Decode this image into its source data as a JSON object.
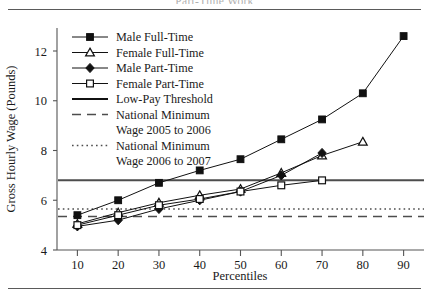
{
  "figure": {
    "clipped_title": "Part-Time Work",
    "has_top_rule": true,
    "has_bottom_rule": true
  },
  "chart_data": {
    "type": "line",
    "title": "",
    "xlabel": "Percentiles",
    "ylabel": "Gross Hourly Wage (Pounds)",
    "x": [
      10,
      20,
      30,
      40,
      50,
      60,
      70,
      80,
      90
    ],
    "xlim": [
      5,
      95
    ],
    "ylim": [
      4,
      13
    ],
    "yticks": [
      4,
      6,
      8,
      10,
      12
    ],
    "xticks": [
      10,
      20,
      30,
      40,
      50,
      60,
      70,
      80,
      90
    ],
    "grid": false,
    "legend_position": "top-left-inside",
    "series": [
      {
        "name": "Male Full-Time",
        "marker": "filled-square",
        "linestyle": "solid",
        "color": "#111111",
        "x": [
          10,
          20,
          30,
          40,
          50,
          60,
          70,
          80,
          90
        ],
        "values": [
          5.4,
          6.0,
          6.7,
          7.2,
          7.65,
          8.45,
          9.25,
          10.3,
          12.6
        ]
      },
      {
        "name": "Female Full-Time",
        "marker": "open-triangle",
        "linestyle": "solid",
        "color": "#111111",
        "x": [
          10,
          20,
          30,
          40,
          50,
          60,
          70,
          80
        ],
        "values": [
          5.05,
          5.5,
          5.9,
          6.2,
          6.45,
          7.1,
          7.8,
          8.35
        ]
      },
      {
        "name": "Male Part-Time",
        "marker": "filled-diamond",
        "linestyle": "solid",
        "color": "#111111",
        "x": [
          10,
          20,
          30,
          40,
          50,
          60,
          70
        ],
        "values": [
          4.95,
          5.2,
          5.65,
          6.0,
          6.35,
          7.0,
          7.9
        ]
      },
      {
        "name": "Female Part-Time",
        "marker": "open-square",
        "linestyle": "solid",
        "color": "#111111",
        "x": [
          10,
          20,
          30,
          40,
          50,
          60,
          70
        ],
        "values": [
          5.0,
          5.4,
          5.8,
          6.05,
          6.35,
          6.6,
          6.8
        ]
      }
    ],
    "reference_lines": [
      {
        "name": "Low-Pay Threshold",
        "linestyle": "solid",
        "value": 6.8,
        "color": "#4d4d4d"
      },
      {
        "name": "National Minimum Wage 2005 to 2006",
        "linestyle": "dashed",
        "value": 5.35,
        "color": "#4d4d4d"
      },
      {
        "name": "National Minimum Wage 2006 to 2007",
        "linestyle": "dotted",
        "value": 5.65,
        "color": "#4d4d4d"
      }
    ],
    "annotations": []
  },
  "legend": {
    "entries": [
      {
        "label": "Male Full-Time",
        "marker": "filled-square",
        "linestyle": "solid"
      },
      {
        "label": "Female Full-Time",
        "marker": "open-triangle",
        "linestyle": "solid"
      },
      {
        "label": "Male Part-Time",
        "marker": "filled-diamond",
        "linestyle": "solid"
      },
      {
        "label": "Female Part-Time",
        "marker": "open-square",
        "linestyle": "solid"
      },
      {
        "label": "Low-Pay Threshold",
        "marker": "none",
        "linestyle": "solid"
      },
      {
        "label": "National Minimum",
        "label2": "Wage 2005 to 2006",
        "marker": "none",
        "linestyle": "dashed"
      },
      {
        "label": "National Minimum",
        "label2": "Wage 2006 to 2007",
        "marker": "none",
        "linestyle": "dotted"
      }
    ]
  },
  "axes": {
    "y_title": "Gross Hourly Wage (Pounds)",
    "x_title": "Percentiles",
    "y_tick_labels": [
      "4",
      "6",
      "8",
      "10",
      "12"
    ],
    "x_tick_labels": [
      "10",
      "20",
      "30",
      "40",
      "50",
      "60",
      "70",
      "80",
      "90"
    ]
  }
}
